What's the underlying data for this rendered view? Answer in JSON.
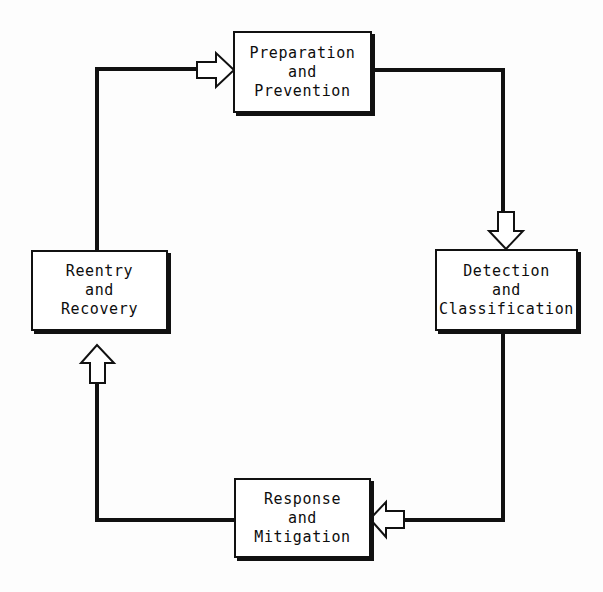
{
  "diagram": {
    "type": "cycle-flow-diagram",
    "background_color": "#fdfdfd",
    "line_color": "#111111",
    "box_fill_color": "#ffffff",
    "arrow_fill_color": "#ffffff",
    "nodes": [
      {
        "id": "preparation",
        "label": "Preparation\nand\nPrevention",
        "position": "top"
      },
      {
        "id": "detection",
        "label": "Detection\nand\nClassification",
        "position": "right"
      },
      {
        "id": "response",
        "label": "Response\nand\nMitigation",
        "position": "bottom"
      },
      {
        "id": "reentry",
        "label": "Reentry\nand\nRecovery",
        "position": "left"
      }
    ],
    "arrows": [
      {
        "id": "arrow-into-preparation",
        "direction": "right",
        "from": "reentry",
        "to": "preparation"
      },
      {
        "id": "arrow-into-detection",
        "direction": "down",
        "from": "preparation",
        "to": "detection"
      },
      {
        "id": "arrow-into-response",
        "direction": "left",
        "from": "detection",
        "to": "response"
      },
      {
        "id": "arrow-into-reentry",
        "direction": "up",
        "from": "response",
        "to": "reentry"
      }
    ]
  }
}
